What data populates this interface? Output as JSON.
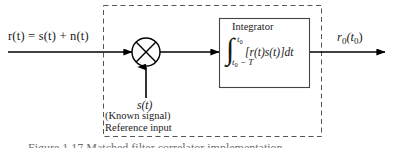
{
  "figure": {
    "width": 395,
    "height": 148,
    "background": "#ffffff",
    "line_color": "#000000",
    "dashed_border_color": "#555555",
    "caption_text": "Figure 1.17   Matched filter correlator implementation.",
    "caption_color": "#6f6f6f"
  },
  "input": {
    "expression": "r(t) = s(t) + n(t)"
  },
  "output": {
    "expression_main": "r",
    "expression_sub1": "0",
    "expression_paren_open": "(t",
    "expression_sub2": "0",
    "expression_paren_close": ")",
    "expression_plain": "r0(t0)"
  },
  "multiplier": {
    "symbol": "cross-in-circle",
    "label": "multiplier"
  },
  "reference": {
    "signal": "s(t)",
    "known_signal": "(Known signal)",
    "input_label": "Reference input"
  },
  "integrator": {
    "title": "Integrator",
    "integral_symbol": "∫",
    "upper_limit_base": "t",
    "upper_limit_sub": "0",
    "lower_limit_base": "t",
    "lower_limit_sub": "0",
    "lower_limit_rest": " − T",
    "integrand": "[r(t)s(t)]dt",
    "expression_plain": "∫ from t0 − T to t0 of [r(t)s(t)]dt"
  }
}
